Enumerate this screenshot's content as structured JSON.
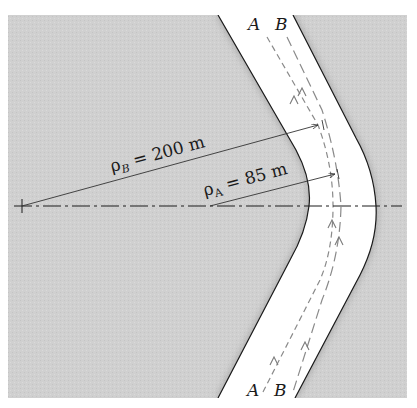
{
  "figure": {
    "type": "road curve diagram",
    "lanes": [
      {
        "id": "A",
        "top_label": "A",
        "bottom_label": "A"
      },
      {
        "id": "B",
        "top_label": "B",
        "bottom_label": "B"
      }
    ],
    "radii": [
      {
        "symbol": "ρ",
        "subscript": "B",
        "text": " = 200 m"
      },
      {
        "symbol": "ρ",
        "subscript": "A",
        "text": " = 85 m"
      }
    ],
    "colors": {
      "ground": "#cfcfcf",
      "road": "#ffffff",
      "edge": "#1a1a1a",
      "path": "#8a8a8a"
    }
  }
}
